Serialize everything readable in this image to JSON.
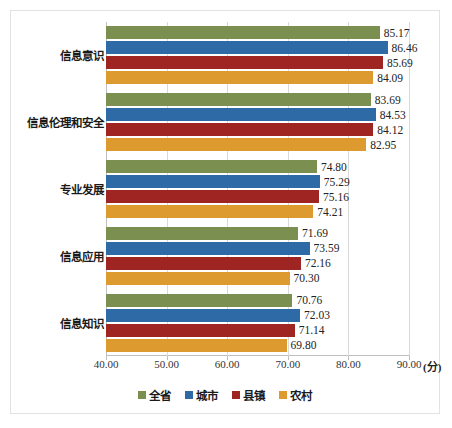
{
  "chart_data": {
    "type": "bar",
    "orientation": "horizontal",
    "title": "",
    "subtitle": "",
    "xlabel": "(分)",
    "ylabel": "",
    "xlim": [
      40.0,
      90.0
    ],
    "xticks": [
      "40.00",
      "50.00",
      "60.00",
      "70.00",
      "80.00",
      "90.00"
    ],
    "xtick_values": [
      40.0,
      50.0,
      60.0,
      70.0,
      80.0,
      90.0
    ],
    "grid": true,
    "legend_position": "bottom",
    "categories": [
      "信息意识",
      "信息伦理和安全",
      "专业发展",
      "信息应用",
      "信息知识"
    ],
    "series": [
      {
        "name": "全省",
        "color": "#7b9050",
        "values": [
          85.17,
          83.69,
          74.8,
          71.69,
          70.76
        ],
        "labels": [
          "85.17",
          "83.69",
          "74.80",
          "71.69",
          "70.76"
        ]
      },
      {
        "name": "城市",
        "color": "#2e6aa5",
        "values": [
          86.46,
          84.53,
          75.29,
          73.59,
          72.03
        ],
        "labels": [
          "86.46",
          "84.53",
          "75.29",
          "73.59",
          "72.03"
        ]
      },
      {
        "name": "县镇",
        "color": "#9e2522",
        "values": [
          85.69,
          84.12,
          75.16,
          72.16,
          71.14
        ],
        "labels": [
          "85.69",
          "84.12",
          "75.16",
          "72.16",
          "71.14"
        ]
      },
      {
        "name": "农村",
        "color": "#dd9a2e",
        "values": [
          84.09,
          82.95,
          74.21,
          70.3,
          69.8
        ],
        "labels": [
          "84.09",
          "82.95",
          "74.21",
          "70.30",
          "69.80"
        ]
      }
    ]
  },
  "axis_unit_suffix": "(分)"
}
